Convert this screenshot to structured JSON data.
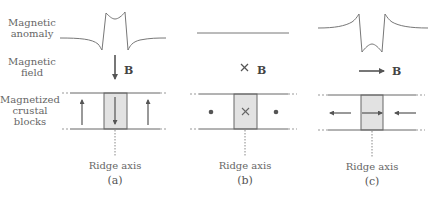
{
  "row_labels": {
    "anomaly": [
      "Magnetic",
      "anomaly"
    ],
    "field": [
      "Magnetic",
      "field"
    ],
    "blocks": [
      "Magnetized",
      "crustal",
      "blocks"
    ]
  },
  "panels": [
    {
      "id": "a",
      "label": "(a)",
      "field_symbol": "B",
      "field_direction": "down",
      "ridge_label": "Ridge axis",
      "side_magnetization": "up",
      "center_magnetization": "down"
    },
    {
      "id": "b",
      "label": "(b)",
      "field_symbol": "B",
      "field_direction": "into-page",
      "ridge_label": "Ridge axis",
      "side_magnetization": "out-of-page",
      "center_magnetization": "into-page"
    },
    {
      "id": "c",
      "label": "(c)",
      "field_symbol": "B",
      "field_direction": "right",
      "ridge_label": "Ridge axis",
      "side_magnetization": "inward",
      "center_magnetization": "right"
    }
  ],
  "colors": {
    "line": "#666666",
    "shade": "#e2e2e2",
    "text": "#666666"
  }
}
